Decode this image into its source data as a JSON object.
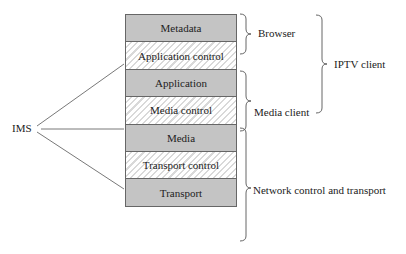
{
  "diagram": {
    "layers": [
      {
        "label": "Metadata",
        "style": "solid"
      },
      {
        "label": "Application control",
        "style": "hatched"
      },
      {
        "label": "Application",
        "style": "solid"
      },
      {
        "label": "Media control",
        "style": "hatched"
      },
      {
        "label": "Media",
        "style": "solid"
      },
      {
        "label": "Transport control",
        "style": "hatched"
      },
      {
        "label": "Transport",
        "style": "solid"
      }
    ],
    "left_label": "IMS",
    "brackets": {
      "browser": "Browser",
      "media_client": "Media client",
      "network": "Network control and transport",
      "iptv_client": "IPTV client"
    },
    "colors": {
      "solid_fill": "#c4c4c4",
      "hatch_stripe": "#d9d9d9",
      "border": "#666666",
      "line": "#555555"
    }
  }
}
